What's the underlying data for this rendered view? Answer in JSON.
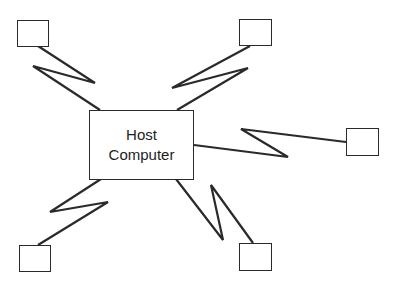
{
  "diagram": {
    "type": "star-network",
    "host": {
      "line1": "Host",
      "line2": "Computer"
    },
    "terminals": [
      {
        "id": "top-left"
      },
      {
        "id": "top-right"
      },
      {
        "id": "right"
      },
      {
        "id": "bottom-left"
      },
      {
        "id": "bottom-right"
      }
    ],
    "links": [
      {
        "from": "host",
        "to": "top-left",
        "style": "lightning"
      },
      {
        "from": "host",
        "to": "top-right",
        "style": "lightning"
      },
      {
        "from": "host",
        "to": "right",
        "style": "lightning"
      },
      {
        "from": "host",
        "to": "bottom-left",
        "style": "lightning"
      },
      {
        "from": "host",
        "to": "bottom-right",
        "style": "lightning"
      }
    ],
    "colors": {
      "stroke": "#2a2a2a",
      "background": "#ffffff"
    }
  }
}
